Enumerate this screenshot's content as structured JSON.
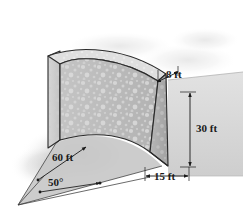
{
  "figure": {
    "background_color": "#ffffff"
  },
  "colors": {
    "concrete_front": "#bdbdbd",
    "concrete_front_light": "#c9c9c9",
    "concrete_end": "#a9a9a9",
    "concrete_left": "#cfcfcf",
    "concrete_top": "#dcdcdc",
    "ground_plane": "#d2d2d2",
    "ground_plane_dark": "#c4c4c4",
    "base_sector": "#c6c6c6",
    "shadow": "#cdcdcd",
    "outline": "#2b2b2b",
    "speckle": "#dddddd",
    "label_text": "#1a1a1a"
  },
  "labels": {
    "top_thickness": "8 ft",
    "height": "30 ft",
    "base_thickness": "15 ft",
    "radius": "60 ft",
    "angle": "50°"
  },
  "dimensions": {
    "top_thickness_value": 8,
    "top_thickness_unit": "ft",
    "height_value": 30,
    "height_unit": "ft",
    "base_thickness_value": 15,
    "base_thickness_unit": "ft",
    "radius_value": 60,
    "radius_unit": "ft",
    "angle_value": 50,
    "angle_unit": "deg"
  }
}
